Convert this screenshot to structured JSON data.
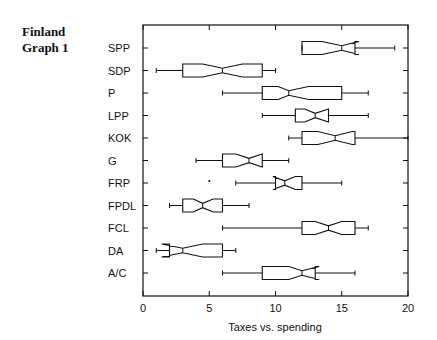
{
  "side_title": {
    "line1": "Finland",
    "line2": "Graph 1"
  },
  "chart_data": {
    "type": "boxplot",
    "orientation": "horizontal",
    "notched": true,
    "title": "Finland Graph 1",
    "xlabel": "Taxes vs. spending",
    "ylabel": "",
    "xlim": [
      0,
      20
    ],
    "xticks": [
      0,
      5,
      10,
      15,
      20
    ],
    "grid": false,
    "legend": null,
    "categories": [
      "SPP",
      "SDP",
      "P",
      "LPP",
      "KOK",
      "G",
      "FRP",
      "FPDL",
      "FCL",
      "DA",
      "A/C"
    ],
    "series": [
      {
        "name": "SPP",
        "whisker_low": 12,
        "q1": 12,
        "median": 15,
        "q3": 16,
        "whisker_high": 19,
        "notch_low": 13.5,
        "notch_high": 16.3,
        "outliers": []
      },
      {
        "name": "SDP",
        "whisker_low": 1,
        "q1": 3,
        "median": 6,
        "q3": 9,
        "whisker_high": 10,
        "notch_low": 4.5,
        "notch_high": 7.5,
        "outliers": []
      },
      {
        "name": "P",
        "whisker_low": 6,
        "q1": 9,
        "median": 11,
        "q3": 15,
        "whisker_high": 17,
        "notch_low": 10.2,
        "notch_high": 12.5,
        "outliers": []
      },
      {
        "name": "LPP",
        "whisker_low": 9,
        "q1": 11.5,
        "median": 13,
        "q3": 14,
        "whisker_high": 17,
        "notch_low": 12.2,
        "notch_high": 14.0,
        "outliers": []
      },
      {
        "name": "KOK",
        "whisker_low": 11,
        "q1": 12,
        "median": 14.5,
        "q3": 16,
        "whisker_high": 20,
        "notch_low": 13.2,
        "notch_high": 15.8,
        "outliers": []
      },
      {
        "name": "G",
        "whisker_low": 4,
        "q1": 6,
        "median": 8,
        "q3": 9,
        "whisker_high": 11,
        "notch_low": 7.0,
        "notch_high": 9.0,
        "outliers": []
      },
      {
        "name": "FRP",
        "whisker_low": 7,
        "q1": 10,
        "median": 10.7,
        "q3": 12,
        "whisker_high": 15,
        "notch_low": 9.8,
        "notch_high": 11.5,
        "outliers": [
          5
        ]
      },
      {
        "name": "FPDL",
        "whisker_low": 2,
        "q1": 3,
        "median": 4.5,
        "q3": 6,
        "whisker_high": 8,
        "notch_low": 3.8,
        "notch_high": 5.3,
        "outliers": []
      },
      {
        "name": "FCL",
        "whisker_low": 6,
        "q1": 12,
        "median": 14,
        "q3": 16,
        "whisker_high": 17,
        "notch_low": 13.0,
        "notch_high": 15.0,
        "outliers": []
      },
      {
        "name": "DA",
        "whisker_low": 1,
        "q1": 2,
        "median": 3,
        "q3": 6,
        "whisker_high": 7,
        "notch_low": 1.4,
        "notch_high": 4.5,
        "outliers": []
      },
      {
        "name": "A/C",
        "whisker_low": 6,
        "q1": 9,
        "median": 12,
        "q3": 13,
        "whisker_high": 16,
        "notch_low": 11.0,
        "notch_high": 13.3,
        "outliers": []
      }
    ]
  },
  "colors": {
    "stroke": "#111111",
    "background": "#ffffff"
  }
}
